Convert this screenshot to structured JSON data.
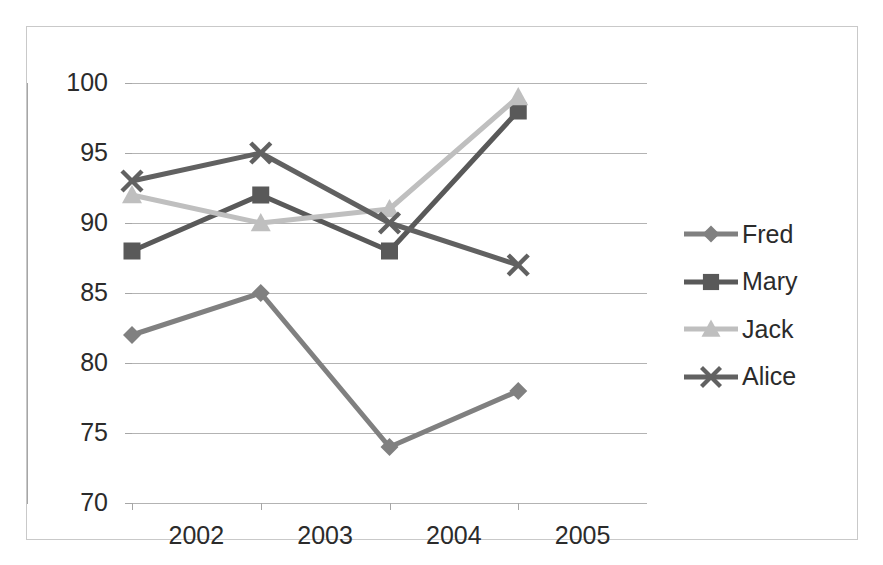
{
  "chart_data": {
    "type": "line",
    "title": "",
    "xlabel": "",
    "ylabel": "",
    "x": [
      2002,
      2003,
      2004,
      2005
    ],
    "categories": [
      "2002",
      "2003",
      "2004",
      "2005"
    ],
    "ylim": [
      70,
      100
    ],
    "ytick_step": 5,
    "yticks": [
      100,
      95,
      90,
      85,
      80,
      75,
      70
    ],
    "ytick_labels": [
      "100",
      "95",
      "90",
      "85",
      "80",
      "75",
      "70"
    ],
    "grid": true,
    "legend_position": "right",
    "series": [
      {
        "name": "Fred",
        "values": [
          82,
          85,
          74,
          78
        ],
        "color": "#808080",
        "marker": "diamond"
      },
      {
        "name": "Mary",
        "values": [
          88,
          92,
          88,
          98
        ],
        "color": "#595959",
        "marker": "square"
      },
      {
        "name": "Jack",
        "values": [
          92,
          90,
          91,
          99
        ],
        "color": "#bfbfbf",
        "marker": "triangle"
      },
      {
        "name": "Alice",
        "values": [
          93,
          95,
          90,
          87
        ],
        "color": "#616161",
        "marker": "x-cross"
      }
    ]
  },
  "legend": {
    "items": [
      {
        "label": "Fred",
        "color": "#808080",
        "marker": "diamond-marker-icon"
      },
      {
        "label": "Mary",
        "color": "#595959",
        "marker": "square-marker-icon"
      },
      {
        "label": "Jack",
        "color": "#bfbfbf",
        "marker": "triangle-marker-icon"
      },
      {
        "label": "Alice",
        "color": "#616161",
        "marker": "x-cross-marker-icon"
      }
    ]
  },
  "axes": {
    "y_labels": [
      "100",
      "95",
      "90",
      "85",
      "80",
      "75",
      "70"
    ],
    "x_labels": [
      "2002",
      "2003",
      "2004",
      "2005"
    ]
  },
  "colors": {
    "frame": "#c9c9c9",
    "gridline": "#b3b3b3",
    "axis": "#a6a6a6",
    "text": "#2b2b2b",
    "background": "#ffffff"
  }
}
